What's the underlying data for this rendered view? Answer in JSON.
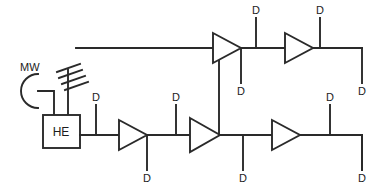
{
  "diagram": {
    "type": "schematic",
    "colors": {
      "line": "#2a2a2a",
      "background": "#ffffff",
      "text": "#1c1c1c"
    },
    "labels": {
      "microwave_dish": "MW",
      "head_end": "HE",
      "drop_tap": "D"
    },
    "sources": [
      {
        "id": "mw-dish",
        "icon": "satellite-dish-icon",
        "label": "MW"
      },
      {
        "id": "yagi-antenna",
        "icon": "antenna-icon",
        "label": ""
      }
    ],
    "head_end": {
      "id": "he-box",
      "label": "HE"
    },
    "amplifiers": [
      {
        "id": "amp-1",
        "row": "bottom",
        "order": 1
      },
      {
        "id": "amp-2",
        "row": "bottom",
        "order": 2
      },
      {
        "id": "amp-3",
        "row": "bottom",
        "order": 3
      },
      {
        "id": "amp-4",
        "row": "top",
        "order": 1
      },
      {
        "id": "amp-5",
        "row": "top",
        "order": 2
      }
    ],
    "taps": [
      {
        "id": "tap-b1",
        "label": "D",
        "row": "bottom",
        "side": "up"
      },
      {
        "id": "tap-b2",
        "label": "D",
        "row": "bottom",
        "side": "down"
      },
      {
        "id": "tap-b3",
        "label": "D",
        "row": "bottom",
        "side": "up"
      },
      {
        "id": "tap-b4",
        "label": "D",
        "row": "bottom",
        "side": "down"
      },
      {
        "id": "tap-b5",
        "label": "D",
        "row": "bottom",
        "side": "up"
      },
      {
        "id": "tap-b6",
        "label": "D",
        "row": "bottom",
        "side": "down"
      },
      {
        "id": "tap-t1",
        "label": "D",
        "row": "top",
        "side": "up"
      },
      {
        "id": "tap-t2",
        "label": "D",
        "row": "top",
        "side": "down"
      },
      {
        "id": "tap-t3",
        "label": "D",
        "row": "top",
        "side": "up"
      },
      {
        "id": "tap-t4",
        "label": "D",
        "row": "top",
        "side": "down"
      }
    ]
  }
}
